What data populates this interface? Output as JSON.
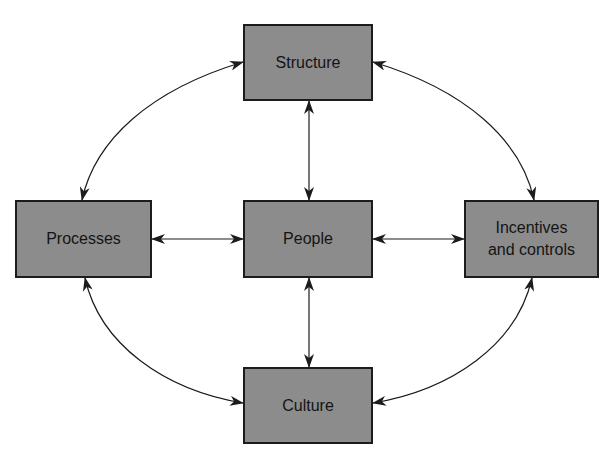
{
  "diagram": {
    "background": "#ffffff",
    "node_fill": "#8c8c8c",
    "node_border": "#1c1c1c",
    "line_color": "#1c1c1c",
    "nodes": {
      "structure": {
        "label": "Structure",
        "x": 243,
        "y": 24,
        "w": 130,
        "h": 77
      },
      "processes": {
        "label": "Processes",
        "x": 15,
        "y": 200,
        "w": 137,
        "h": 78
      },
      "people": {
        "label": "People",
        "x": 243,
        "y": 200,
        "w": 130,
        "h": 78
      },
      "incentives": {
        "label": "Incentives\nand controls",
        "x": 464,
        "y": 200,
        "w": 135,
        "h": 78
      },
      "culture": {
        "label": "Culture",
        "x": 243,
        "y": 367,
        "w": 130,
        "h": 77
      }
    },
    "edges": [
      {
        "from": "structure",
        "to": "people",
        "type": "straight",
        "bidirectional": true
      },
      {
        "from": "processes",
        "to": "people",
        "type": "straight",
        "bidirectional": true
      },
      {
        "from": "people",
        "to": "incentives",
        "type": "straight",
        "bidirectional": true
      },
      {
        "from": "people",
        "to": "culture",
        "type": "straight",
        "bidirectional": true
      },
      {
        "from": "structure",
        "to": "processes",
        "type": "curved",
        "bidirectional": true
      },
      {
        "from": "structure",
        "to": "incentives",
        "type": "curved",
        "bidirectional": true
      },
      {
        "from": "processes",
        "to": "culture",
        "type": "curved",
        "bidirectional": true
      },
      {
        "from": "incentives",
        "to": "culture",
        "type": "curved",
        "bidirectional": true
      }
    ]
  }
}
